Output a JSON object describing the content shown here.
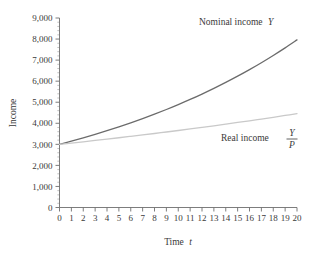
{
  "chart_data": {
    "type": "line",
    "title": "",
    "xlabel": "Time t",
    "ylabel": "Income",
    "xlim": [
      0,
      20
    ],
    "ylim": [
      0,
      9000
    ],
    "grid": false,
    "legend_position": "inline-annotation",
    "x": [
      0,
      1,
      2,
      3,
      4,
      5,
      6,
      7,
      8,
      9,
      10,
      11,
      12,
      13,
      14,
      15,
      16,
      17,
      18,
      19,
      20
    ],
    "xticklabels": [
      "0",
      "1",
      "2",
      "3",
      "4",
      "5",
      "6",
      "7",
      "8",
      "9",
      "10",
      "11",
      "12",
      "13",
      "14",
      "15",
      "16",
      "17",
      "18",
      "19",
      "20"
    ],
    "yticks": [
      0,
      1000,
      2000,
      3000,
      4000,
      5000,
      6000,
      7000,
      8000,
      9000
    ],
    "yticklabels": [
      "0",
      "1,000",
      "2,000",
      "3,000",
      "4,000",
      "5,000",
      "6,000",
      "7,000",
      "8,000",
      "9,000"
    ],
    "y_minor_tick_interval": 200,
    "series": [
      {
        "name": "Nominal income Y",
        "label_text": "Nominal income",
        "label_symbol": "Y",
        "color": "#6b6b6b",
        "width": 1.3,
        "values": [
          3000,
          3150,
          3308,
          3473,
          3647,
          3829,
          4020,
          4221,
          4432,
          4654,
          4887,
          5131,
          5388,
          5657,
          5940,
          6237,
          6549,
          6876,
          7220,
          7581,
          7960
        ]
      },
      {
        "name": "Real income Y/P",
        "label_text": "Real income",
        "label_numerator": "Y",
        "label_denominator": "P",
        "color": "#c9c9c9",
        "width": 1.3,
        "values": [
          3000,
          3060,
          3121,
          3184,
          3247,
          3312,
          3379,
          3446,
          3515,
          3585,
          3657,
          3730,
          3805,
          3881,
          3959,
          4038,
          4118,
          4201,
          4285,
          4371,
          4458
        ]
      }
    ]
  },
  "axes": {
    "y_title": "Income",
    "x_title_text": "Time",
    "x_title_symbol": "t"
  }
}
